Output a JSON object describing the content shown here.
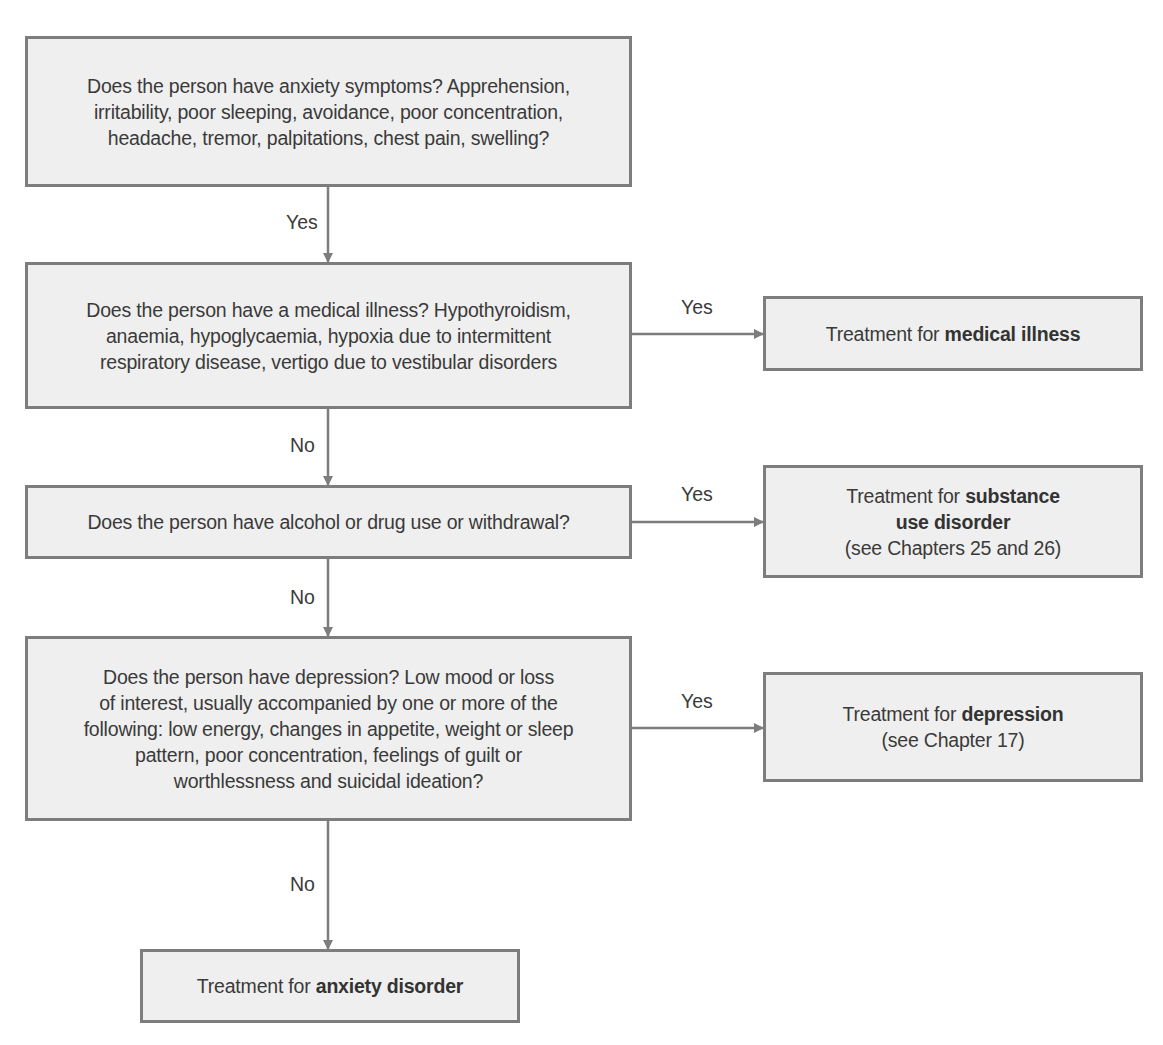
{
  "flowchart": {
    "nodes": {
      "anxiety_symptoms": {
        "lines": [
          "Does the person have anxiety symptoms? Apprehension,",
          "irritability, poor sleeping, avoidance, poor concentration,",
          "headache, tremor, palpitations, chest pain, swelling?"
        ]
      },
      "medical_illness": {
        "lines": [
          "Does the person have a medical illness? Hypothyroidism,",
          "anaemia, hypoglycaemia, hypoxia due to intermittent",
          "respiratory disease, vertigo due to vestibular disorders"
        ]
      },
      "substance_use": {
        "lines": [
          "Does the person have alcohol or drug use or withdrawal?"
        ]
      },
      "depression": {
        "lines": [
          "Does the person have depression? Low mood or loss",
          "of interest, usually accompanied by one or more of the",
          "following: low energy, changes in appetite, weight or sleep",
          "pattern, poor concentration, feelings of guilt or",
          "worthlessness and suicidal ideation?"
        ]
      },
      "treat_medical": {
        "prefix": "Treatment for ",
        "bold": "medical illness"
      },
      "treat_substance": {
        "prefix": "Treatment for ",
        "bold1": "substance",
        "bold2": "use disorder",
        "note": "(see Chapters 25 and 26)"
      },
      "treat_depression": {
        "prefix": "Treatment for ",
        "bold": "depression",
        "note": "(see Chapter 17)"
      },
      "treat_anxiety": {
        "prefix": "Treatment for ",
        "bold": "anxiety disorder"
      }
    },
    "edges": {
      "e1": "Yes",
      "e2": "No",
      "e3": "No",
      "e4": "No",
      "m_yes": "Yes",
      "s_yes": "Yes",
      "d_yes": "Yes"
    },
    "colors": {
      "box_fill": "#efefef",
      "border": "#7d7d7d",
      "text": "#3a3a3a"
    }
  }
}
